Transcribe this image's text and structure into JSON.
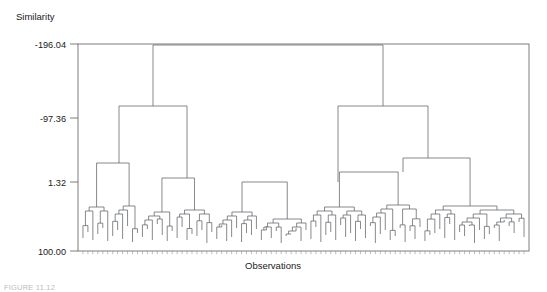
{
  "figure": {
    "caption": "FIGURE 11.12",
    "y_axis_title": "Similarity",
    "x_axis_title": "Observations"
  },
  "chart_data": {
    "type": "dendrogram",
    "title": "",
    "xlabel": "Observations",
    "ylabel": "Similarity",
    "grid": false,
    "legend": null,
    "y_ticks": [
      "-196.04",
      "-97.36",
      "1.32",
      "100.00"
    ],
    "y_tick_values": [
      -196.04,
      -97.36,
      1.32,
      100.0
    ],
    "ylim": [
      -196.04,
      100.0
    ],
    "y_axis_inverted": true,
    "n_leaves": 90,
    "axis_frame": {
      "left": 78,
      "top": 44,
      "right": 529,
      "bottom": 251
    },
    "y_tick_pixels": [
      44,
      118,
      182,
      251
    ],
    "note": "Agglomerative hierarchical clustering dendrogram; similarity decreases upward (root merges at -196.04).",
    "merges": [
      {
        "id": "root",
        "x": 268.0,
        "y": 45.0,
        "left_x": 153.0,
        "right_x": 383.0,
        "left_y": 106.0,
        "right_y": 106.0
      },
      {
        "id": "L1",
        "x": 153.0,
        "y": 106.0,
        "left_x": 119.0,
        "right_x": 187.0,
        "left_y": 163.0,
        "right_y": 178.0
      },
      {
        "id": "R1",
        "x": 383.0,
        "y": 106.0,
        "left_x": 338.0,
        "right_x": 428.0,
        "left_y": 182.0,
        "right_y": 158.0
      },
      {
        "id": "L1a",
        "x": 119.0,
        "y": 163.0,
        "left_x": 103.0,
        "right_x": 135.0,
        "left_y": 198.0,
        "right_y": 197.0
      },
      {
        "id": "L1b",
        "x": 187.0,
        "y": 178.0,
        "left_x": 168.0,
        "right_x": 206.0,
        "left_y": 203.0,
        "right_y": 201.0
      },
      {
        "id": "R1a",
        "x": 338.0,
        "y": 182.0,
        "left_x": 320.0,
        "right_x": 356.0,
        "left_y": 203.0,
        "right_y": 210.0
      },
      {
        "id": "R1b",
        "x": 428.0,
        "y": 158.0,
        "left_x": 403.0,
        "right_x": 460.0,
        "left_y": 172.0,
        "right_y": 197.0
      },
      {
        "id": "R1b1",
        "x": 403.0,
        "y": 172.0,
        "left_x": 386.0,
        "right_x": 420.0,
        "left_y": 198.0,
        "right_y": 196.0
      }
    ],
    "leaf_heights_px": [
      238,
      232,
      240,
      234,
      228,
      241,
      236,
      230,
      239,
      226,
      242,
      233,
      237,
      229,
      240,
      224,
      235,
      241,
      231,
      238,
      227,
      240,
      234,
      236,
      230,
      243,
      232,
      239,
      225,
      241,
      237,
      228,
      242,
      233,
      235,
      229,
      240,
      226,
      238,
      231,
      243,
      236,
      234,
      228,
      241,
      230,
      239,
      227,
      242,
      235,
      232,
      240,
      225,
      237,
      233,
      241,
      229,
      238,
      226,
      243,
      234,
      230,
      240,
      236,
      228,
      242,
      231,
      239,
      227,
      241,
      235,
      233,
      229,
      238,
      224,
      240,
      232,
      236,
      226,
      243,
      230,
      239,
      234,
      228,
      241,
      220,
      226,
      233,
      222,
      237
    ]
  }
}
